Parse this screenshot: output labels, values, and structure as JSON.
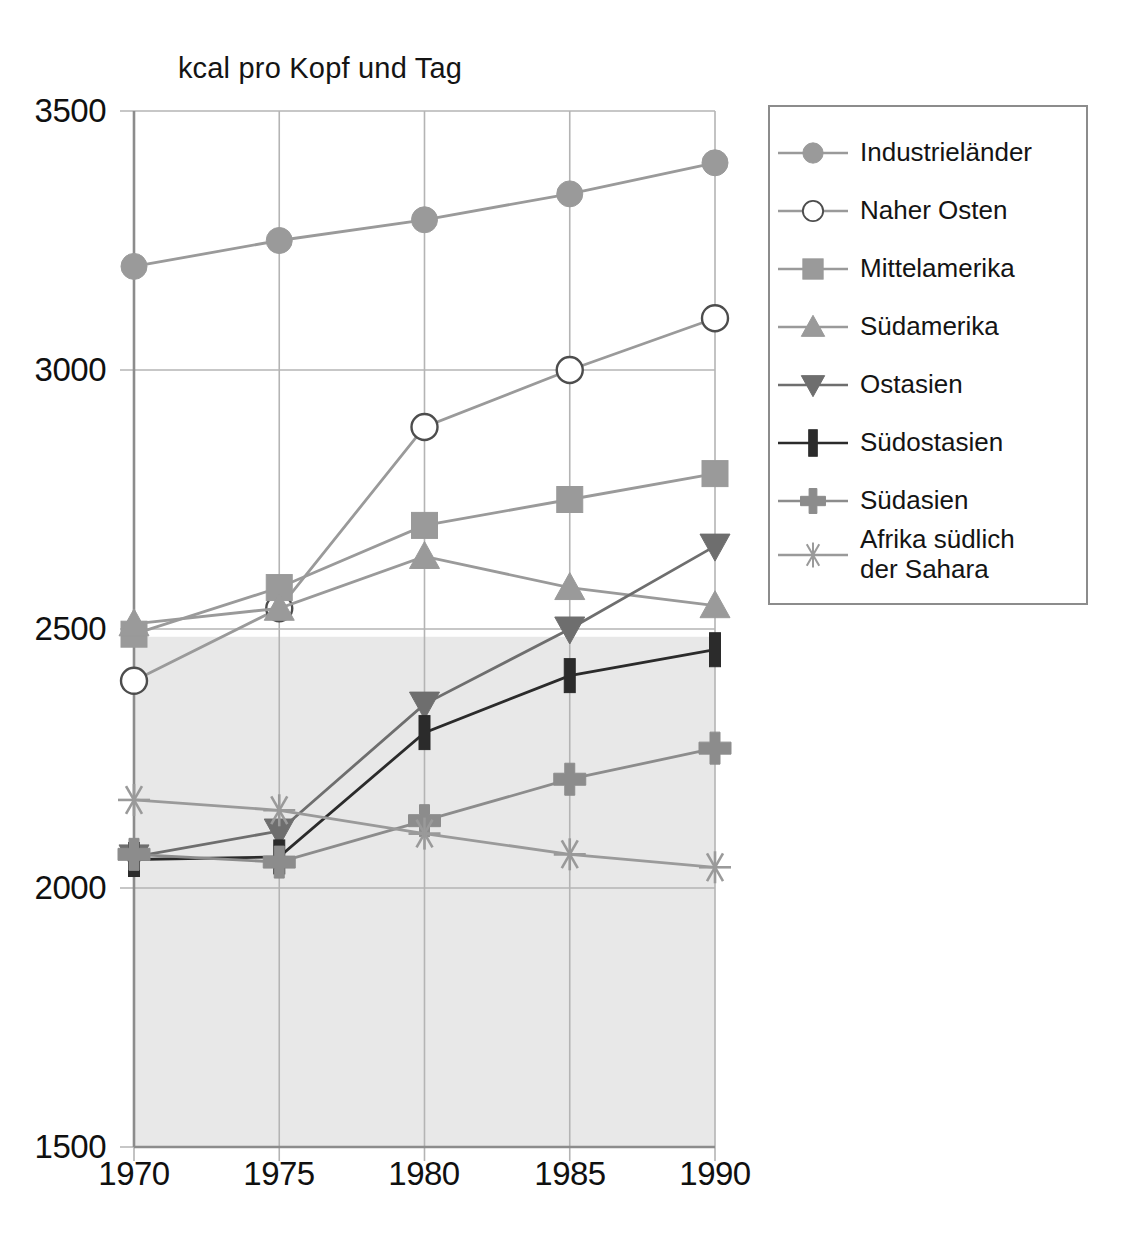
{
  "chart_data": {
    "type": "line",
    "title": "kcal pro Kopf und Tag",
    "xlabel": "",
    "ylabel": "",
    "x": [
      1970,
      1975,
      1980,
      1985,
      1990
    ],
    "xticklabels": [
      "1970",
      "1975",
      "1980",
      "1985",
      "1990"
    ],
    "yticklabels": [
      "3500",
      "3000",
      "2500",
      "2000",
      "1500"
    ],
    "yticks": [
      3500,
      3000,
      2500,
      2000,
      1500
    ],
    "ylim": [
      1500,
      3500
    ],
    "xlim": [
      1970,
      1990
    ],
    "grid": true,
    "legend_position": "right",
    "series": [
      {
        "name": "Industrieländer",
        "marker": "circle-filled",
        "color": "#9a9a9a",
        "values": [
          3200,
          3250,
          3290,
          3340,
          3400
        ]
      },
      {
        "name": "Naher Osten",
        "marker": "circle-open",
        "color": "#9a9a9a",
        "values": [
          2400,
          2540,
          2890,
          3000,
          3100
        ]
      },
      {
        "name": "Mittelamerika",
        "marker": "square-filled",
        "color": "#9a9a9a",
        "values": [
          2490,
          2580,
          2700,
          2750,
          2800
        ]
      },
      {
        "name": "Südamerika",
        "marker": "triangle-up",
        "color": "#9a9a9a",
        "values": [
          2510,
          2540,
          2640,
          2580,
          2545
        ]
      },
      {
        "name": "Ostasien",
        "marker": "triangle-down",
        "color": "#6e6e6e",
        "values": [
          2060,
          2110,
          2355,
          2500,
          2660
        ]
      },
      {
        "name": "Südostasien",
        "marker": "bar-vertical",
        "color": "#2b2b2b",
        "values": [
          2055,
          2060,
          2300,
          2410,
          2460
        ]
      },
      {
        "name": "Südasien",
        "marker": "plus-filled",
        "color": "#8c8c8c",
        "values": [
          2065,
          2050,
          2130,
          2210,
          2270
        ]
      },
      {
        "name": "Afrika südlich der Sahara",
        "marker": "asterisk",
        "color": "#9a9a9a",
        "values": [
          2170,
          2150,
          2105,
          2065,
          2040
        ]
      }
    ]
  },
  "legend": {
    "labels": [
      "Industrieländer",
      "Naher Osten",
      "Mittelamerika",
      "Südamerika",
      "Ostasien",
      "Südostasien",
      "Südasien",
      "Afrika südlich\nder Sahara"
    ]
  },
  "colors": {
    "grid": "#b4b4b4",
    "axis": "#8c8c8c",
    "shade": "#e8e8e8",
    "text": "#141414"
  }
}
